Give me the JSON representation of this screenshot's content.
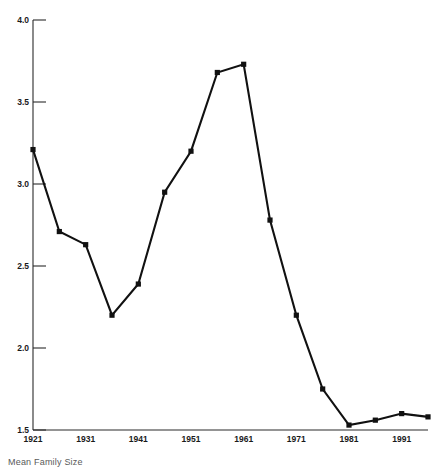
{
  "chart_data": {
    "type": "line",
    "title": "",
    "subtitle": "",
    "xlabel": "",
    "ylabel": "",
    "xlim": [
      1921,
      1996
    ],
    "ylim": [
      1.5,
      4.0
    ],
    "grid": false,
    "legend_position": "none",
    "x_tick_labels": [
      "1921",
      "1931",
      "1941",
      "1951",
      "1961",
      "1971",
      "1981",
      "1991"
    ],
    "x_tick_values": [
      1921,
      1931,
      1941,
      1951,
      1961,
      1971,
      1981,
      1991
    ],
    "y_tick_labels": [
      "4.0",
      "3.5",
      "3.0",
      "2.5",
      "2.0",
      "1.5"
    ],
    "y_tick_values": [
      4.0,
      3.5,
      3.0,
      2.5,
      2.0,
      1.5
    ],
    "series": [
      {
        "name": "Mean family size",
        "x": [
          1921,
          1926,
          1931,
          1936,
          1941,
          1946,
          1951,
          1956,
          1961,
          1966,
          1971,
          1976,
          1981,
          1986,
          1991,
          1996
        ],
        "values": [
          3.21,
          2.71,
          2.63,
          2.2,
          2.39,
          2.95,
          3.2,
          3.68,
          3.73,
          2.78,
          2.2,
          1.75,
          1.53,
          1.56,
          1.6,
          1.58
        ]
      }
    ]
  },
  "caption": {
    "text": "Mean Family Size"
  }
}
